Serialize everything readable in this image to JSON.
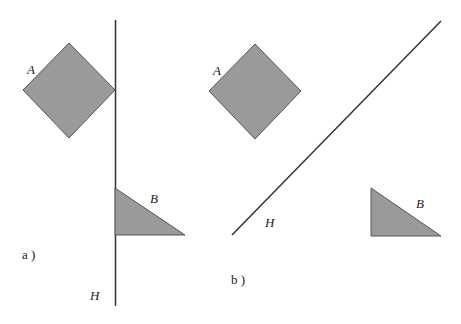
{
  "panels": [
    {
      "id": "a",
      "caption": "a )",
      "shape_a_label": "A",
      "shape_b_label": "B",
      "line_label": "H"
    },
    {
      "id": "b",
      "caption": "b )",
      "shape_a_label": "A",
      "shape_b_label": "B",
      "line_label": "H"
    }
  ],
  "colors": {
    "shape_fill": "#9a9a9a",
    "stroke": "#333333",
    "background": "#ffffff"
  }
}
